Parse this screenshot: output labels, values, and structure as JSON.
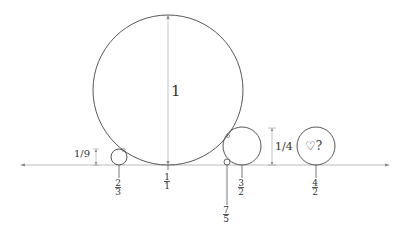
{
  "diagram": {
    "type": "ford-circles",
    "big_circle_label": "1",
    "labels": {
      "one_ninth": "1/9",
      "one_quarter": "1/4",
      "mystery": "♡?"
    },
    "fractions": [
      {
        "id": "f_2_3",
        "num": "2",
        "den": "3"
      },
      {
        "id": "f_1_1",
        "num": "1",
        "den": "1"
      },
      {
        "id": "f_7_5",
        "num": "7",
        "den": "5"
      },
      {
        "id": "f_3_2",
        "num": "3",
        "den": "2"
      },
      {
        "id": "f_4_2",
        "num": "4",
        "den": "2"
      }
    ],
    "colors": {
      "stroke": "#444444",
      "axis": "#999999",
      "text": "#333333"
    }
  }
}
